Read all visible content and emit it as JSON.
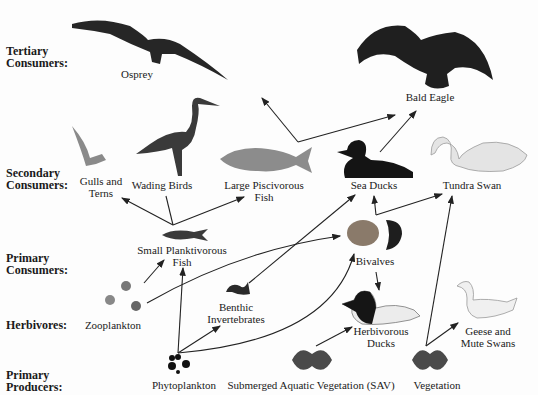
{
  "levels": [
    {
      "line1": "Tertiary",
      "line2": "Consumers:",
      "y": 45
    },
    {
      "line1": "Secondary",
      "line2": "Consumers:",
      "y": 163
    },
    {
      "line1": "Primary",
      "line2": "Consumers:",
      "y": 252
    },
    {
      "line1": "Herbivores:",
      "line2": "",
      "y": 319
    },
    {
      "line1": "Primary",
      "line2": "Producers:",
      "y": 367
    }
  ],
  "organisms": [
    {
      "id": "osprey",
      "line1": "Osprey",
      "line2": "",
      "x": 137,
      "y": 71
    },
    {
      "id": "bald-eagle",
      "line1": "Bald Eagle",
      "line2": "",
      "x": 290,
      "y": 93
    },
    {
      "id": "gulls-terns",
      "line1": "Gulls and",
      "line2": "Terns",
      "x": 101,
      "y": 175
    },
    {
      "id": "wading-birds",
      "line1": "Wading Birds",
      "line2": "",
      "x": 162,
      "y": 180
    },
    {
      "id": "large-piscivorous-fish",
      "line1": "Large Piscivorous",
      "line2": "Fish",
      "x": 264,
      "y": 180
    },
    {
      "id": "sea-ducks",
      "line1": "Sea Ducks",
      "line2": "",
      "x": 374,
      "y": 180
    },
    {
      "id": "tundra-swan",
      "line1": "Tundra Swan",
      "line2": "",
      "x": 472,
      "y": 180
    },
    {
      "id": "small-planktivorous-fish",
      "line1": "Small Planktivorous",
      "line2": "Fish",
      "x": 182,
      "y": 246
    },
    {
      "id": "bivalves",
      "line1": "Bivalves",
      "line2": "",
      "x": 375,
      "y": 257
    },
    {
      "id": "zooplankton",
      "line1": "Zooplankton",
      "line2": "",
      "x": 113,
      "y": 320
    },
    {
      "id": "benthic-invertebrates",
      "line1": "Benthic",
      "line2": "Invertebrates",
      "x": 236,
      "y": 303
    },
    {
      "id": "herbivorous-ducks",
      "line1": "Herbivorous",
      "line2": "Ducks",
      "x": 381,
      "y": 326
    },
    {
      "id": "geese-mute-swans",
      "line1": "Geese and",
      "line2": "Mute Swans",
      "x": 488,
      "y": 326
    },
    {
      "id": "phytoplankton",
      "line1": "Phytoplankton",
      "line2": "",
      "x": 184,
      "y": 380
    },
    {
      "id": "sav",
      "line1": "Submerged Aquatic Vegetation (SAV)",
      "line2": "",
      "x": 311,
      "y": 380
    },
    {
      "id": "vegetation",
      "line1": "Vegetation",
      "line2": "",
      "x": 437,
      "y": 380
    }
  ],
  "arrows": [
    {
      "from": "large-piscivorous-fish",
      "to": "osprey",
      "d": "M 298 142 L 262 98 M 298 142 L 395 115"
    },
    {
      "from": "large-piscivorous-fish",
      "to": "bald-eagle",
      "d": "M 298 142 L 395 115"
    },
    {
      "from": "sea-ducks",
      "to": "bald-eagle",
      "d": "M 380 152 L 416 111"
    },
    {
      "from": "small-planktivorous-fish",
      "to": "gulls-terns",
      "d": "M 173 225 L 122 198"
    },
    {
      "from": "small-planktivorous-fish",
      "to": "wading-birds",
      "d": "M 173 225 L 166 196"
    },
    {
      "from": "small-planktivorous-fish",
      "to": "large-piscivorous-fish",
      "d": "M 173 225 L 244 197"
    },
    {
      "from": "zooplankton",
      "to": "small-planktivorous-fish",
      "d": "M 144 283 L 164 260"
    },
    {
      "from": "zooplankton",
      "to": "bivalves",
      "d": "M 147 303 Q 240 250 340 236"
    },
    {
      "from": "phytoplankton",
      "to": "small-planktivorous-fish",
      "d": "M 178 353 L 183 268"
    },
    {
      "from": "phytoplankton",
      "to": "benthic-invertebrates",
      "d": "M 178 353 L 220 326"
    },
    {
      "from": "phytoplankton",
      "to": "bivalves",
      "d": "M 178 353 Q 330 340 354 254"
    },
    {
      "from": "benthic-invertebrates",
      "to": "sea-ducks",
      "d": "M 249 283 L 355 195"
    },
    {
      "from": "bivalves",
      "to": "sea-ducks",
      "d": "M 376 215 L 374 196"
    },
    {
      "from": "bivalves",
      "to": "tundra-swan",
      "d": "M 376 215 L 442 194"
    },
    {
      "from": "bivalves",
      "to": "herbivorous-ducks",
      "d": "M 376 272 L 379 290"
    },
    {
      "from": "sav",
      "to": "herbivorous-ducks",
      "d": "M 316 346 L 352 327"
    },
    {
      "from": "vegetation",
      "to": "tundra-swan",
      "d": "M 426 346 L 452 196"
    },
    {
      "from": "vegetation",
      "to": "geese-mute-swans",
      "d": "M 426 346 L 458 323"
    }
  ],
  "colors": {
    "text": "#1a1a1a",
    "arrow": "#222222",
    "background": "#fdfdfd",
    "bird_dark": "#262626",
    "bird_light": "#e4e4e4"
  }
}
